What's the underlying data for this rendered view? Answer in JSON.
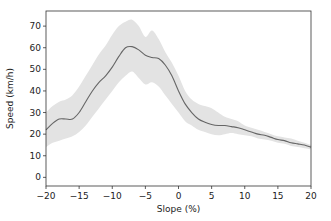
{
  "chart_data": {
    "type": "line",
    "title": "",
    "xlabel": "Slope (%)",
    "ylabel": "Speed (km/h)",
    "xlim": [
      -20,
      20
    ],
    "ylim": [
      -4,
      77
    ],
    "xticks": [
      -20,
      -15,
      -10,
      -5,
      0,
      5,
      10,
      15,
      20
    ],
    "xtick_labels": [
      "−20",
      "−15",
      "−10",
      "−5",
      "0",
      "5",
      "10",
      "15",
      "20"
    ],
    "yticks": [
      0,
      10,
      20,
      30,
      40,
      50,
      60,
      70
    ],
    "ytick_labels": [
      "0",
      "10",
      "20",
      "30",
      "40",
      "50",
      "60",
      "70"
    ],
    "grid": false,
    "legend": null,
    "series": [
      {
        "name": "mean speed",
        "color": "#666666",
        "x": [
          -20,
          -19,
          -18,
          -17,
          -16,
          -15,
          -14,
          -13,
          -12,
          -11,
          -10,
          -9,
          -8,
          -7,
          -6,
          -5,
          -4,
          -3,
          -2,
          -1,
          0,
          1,
          2,
          3,
          4,
          5,
          6,
          7,
          8,
          9,
          10,
          11,
          12,
          13,
          14,
          15,
          16,
          17,
          18,
          19,
          20
        ],
        "values": [
          22,
          25,
          27,
          27,
          27,
          30,
          35,
          40,
          44,
          47,
          51,
          56,
          60,
          60.5,
          59,
          56.5,
          55.5,
          55,
          52,
          47,
          40,
          34,
          30,
          27,
          25.5,
          24.5,
          24,
          24,
          23.5,
          23,
          22,
          21,
          20,
          19.5,
          18.5,
          17.5,
          17,
          16,
          15.5,
          15,
          14
        ]
      }
    ],
    "band": {
      "name": "spread",
      "color": "#e3e3e3",
      "x": [
        -20,
        -19,
        -18,
        -17,
        -16,
        -15,
        -14,
        -13,
        -12,
        -11,
        -10,
        -9,
        -8,
        -7,
        -6,
        -5,
        -4,
        -3,
        -2,
        -1,
        0,
        1,
        2,
        3,
        4,
        5,
        6,
        7,
        8,
        9,
        10,
        11,
        12,
        13,
        14,
        15,
        16,
        17,
        18,
        19,
        20
      ],
      "upper": [
        30,
        33,
        35,
        36,
        38,
        42,
        47,
        52,
        57,
        61,
        66,
        70,
        72,
        73,
        70,
        65,
        68,
        64,
        58,
        53,
        47,
        40,
        36,
        34,
        33,
        32,
        30,
        28,
        27,
        26,
        24,
        23,
        22,
        21,
        20,
        19,
        18.5,
        18,
        17,
        16,
        15
      ],
      "lower": [
        14,
        16,
        17,
        18,
        19,
        21,
        24,
        28,
        32,
        36,
        40,
        44,
        47,
        49,
        46,
        43,
        44,
        42,
        38,
        34,
        30,
        26,
        24,
        22,
        21,
        20,
        19.5,
        20,
        20.5,
        20,
        19.5,
        19,
        18,
        17.5,
        17,
        16,
        15.5,
        14.5,
        14,
        13.5,
        13
      ]
    }
  }
}
